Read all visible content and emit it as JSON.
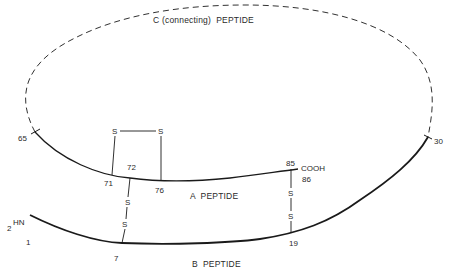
{
  "diagram": {
    "type": "proinsulin-structure",
    "colors": {
      "line": "#1a1a1a",
      "text": "#2a2a2a",
      "background": "#ffffff"
    },
    "chains": {
      "c_peptide": {
        "label": "C (connecting)  PEPTIDE",
        "style": "dashed"
      },
      "a_peptide": {
        "label": "A  PEPTIDE",
        "style": "solid"
      },
      "b_peptide": {
        "label": "B  PEPTIDE",
        "style": "solid-thick"
      }
    },
    "termini": {
      "amino": {
        "subscript": "2",
        "label": "HN"
      },
      "carboxyl": {
        "label": "COOH"
      }
    },
    "residue_numbers": {
      "r1": "1",
      "r7": "7",
      "r19": "19",
      "r30": "30",
      "r65": "65",
      "r71": "71",
      "r72": "72",
      "r76": "76",
      "r85": "85",
      "r86": "86"
    },
    "disulfide_bonds": {
      "intra_a": {
        "from": "71",
        "to": "76",
        "s1": "S",
        "s2": "S"
      },
      "a72_b7": {
        "from": "72",
        "to": "7",
        "s1": "S",
        "s2": "S"
      },
      "a85_b19": {
        "from": "85",
        "to": "19",
        "s1": "S",
        "s2": "S"
      }
    }
  }
}
